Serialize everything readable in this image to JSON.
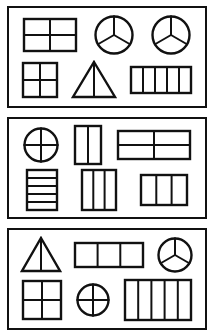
{
  "worksheet": {
    "title": "Equal parts of shapes worksheet",
    "background_color": "#ffffff",
    "ink_color": "#111111",
    "panel_count": 3,
    "panels": [
      {
        "label": "panel-1",
        "rows": [
          [
            {
              "name": "rectangle-4-parts",
              "shape": "rectangle",
              "parts": 4,
              "division": "2x2-grid",
              "orientation": "wide"
            },
            {
              "name": "circle-3-parts",
              "shape": "circle",
              "parts": 3,
              "division": "three-radii",
              "orientation": "y-shape"
            },
            {
              "name": "circle-3-parts",
              "shape": "circle",
              "parts": 3,
              "division": "three-radii",
              "orientation": "y-shape"
            }
          ],
          [
            {
              "name": "square-4-parts",
              "shape": "square",
              "parts": 4,
              "division": "2x2-grid",
              "orientation": "upright"
            },
            {
              "name": "triangle-2-parts",
              "shape": "triangle",
              "parts": 2,
              "division": "vertical-median",
              "orientation": "upright"
            },
            {
              "name": "rectangle-5-parts",
              "shape": "rectangle",
              "parts": 5,
              "division": "vertical-strips",
              "orientation": "wide"
            }
          ]
        ]
      },
      {
        "label": "panel-2",
        "rows": [
          [
            {
              "name": "circle-4-parts",
              "shape": "circle",
              "parts": 4,
              "division": "cross-quarters",
              "orientation": "upright"
            },
            {
              "name": "rectangle-2-parts",
              "shape": "rectangle",
              "parts": 2,
              "division": "vertical-strips",
              "orientation": "tall"
            },
            {
              "name": "rectangle-4-parts",
              "shape": "rectangle",
              "parts": 4,
              "division": "2x2-grid",
              "orientation": "wide"
            }
          ],
          [
            {
              "name": "rectangle-5-parts",
              "shape": "rectangle",
              "parts": 5,
              "division": "horizontal-strips",
              "orientation": "tall"
            },
            {
              "name": "rectangle-3-parts",
              "shape": "rectangle",
              "parts": 3,
              "division": "vertical-strips",
              "orientation": "tall"
            },
            {
              "name": "rectangle-3-parts",
              "shape": "rectangle",
              "parts": 3,
              "division": "vertical-strips",
              "orientation": "wide"
            }
          ]
        ]
      },
      {
        "label": "panel-3",
        "rows": [
          [
            {
              "name": "triangle-2-parts",
              "shape": "triangle",
              "parts": 2,
              "division": "vertical-median",
              "orientation": "upright"
            },
            {
              "name": "rectangle-3-parts",
              "shape": "rectangle",
              "parts": 3,
              "division": "vertical-strips",
              "orientation": "wide"
            },
            {
              "name": "circle-3-parts",
              "shape": "circle",
              "parts": 3,
              "division": "three-radii",
              "orientation": "y-shape"
            }
          ],
          [
            {
              "name": "square-4-parts",
              "shape": "square",
              "parts": 4,
              "division": "2x2-grid",
              "orientation": "upright"
            },
            {
              "name": "circle-4-parts",
              "shape": "circle",
              "parts": 4,
              "division": "cross-quarters",
              "orientation": "upright"
            },
            {
              "name": "rectangle-5-parts",
              "shape": "rectangle",
              "parts": 5,
              "division": "vertical-strips",
              "orientation": "wide"
            }
          ]
        ]
      }
    ]
  }
}
